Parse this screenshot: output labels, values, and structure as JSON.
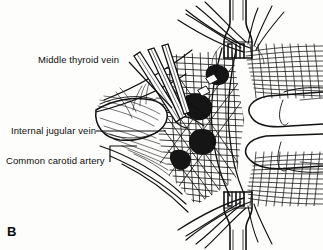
{
  "figure": {
    "panel_letter": "B",
    "type": "anatomical-line-drawing",
    "background_color": "#fdfdfc",
    "ink_color": "#111111"
  },
  "labels": [
    {
      "id": "middle-thyroid-vein",
      "text": "Middle thyroid vein",
      "x": 38,
      "y": 55,
      "leader": {
        "type": "diagonal",
        "from": [
          129,
          62
        ],
        "to": [
          172,
          108
        ]
      }
    },
    {
      "id": "internal-jugular-vein",
      "text": "Internal jugular vein",
      "x": 11,
      "y": 126,
      "leader": {
        "type": "horizontal",
        "from": [
          96,
          131
        ],
        "to": [
          166,
          131
        ]
      }
    },
    {
      "id": "common-carotid-artery",
      "text": "Common carotid artery",
      "x": 6,
      "y": 156,
      "leader": {
        "type": "elbow",
        "from": [
          110,
          162
        ],
        "corner": [
          110,
          146
        ],
        "to": [
          137,
          146
        ]
      }
    }
  ],
  "instruments": {
    "retractor_top": "three-pronged self-retaining retractor",
    "retractor_bottom": "three-pronged self-retaining retractor",
    "forceps": "three converging forceps shafts from upper left"
  }
}
